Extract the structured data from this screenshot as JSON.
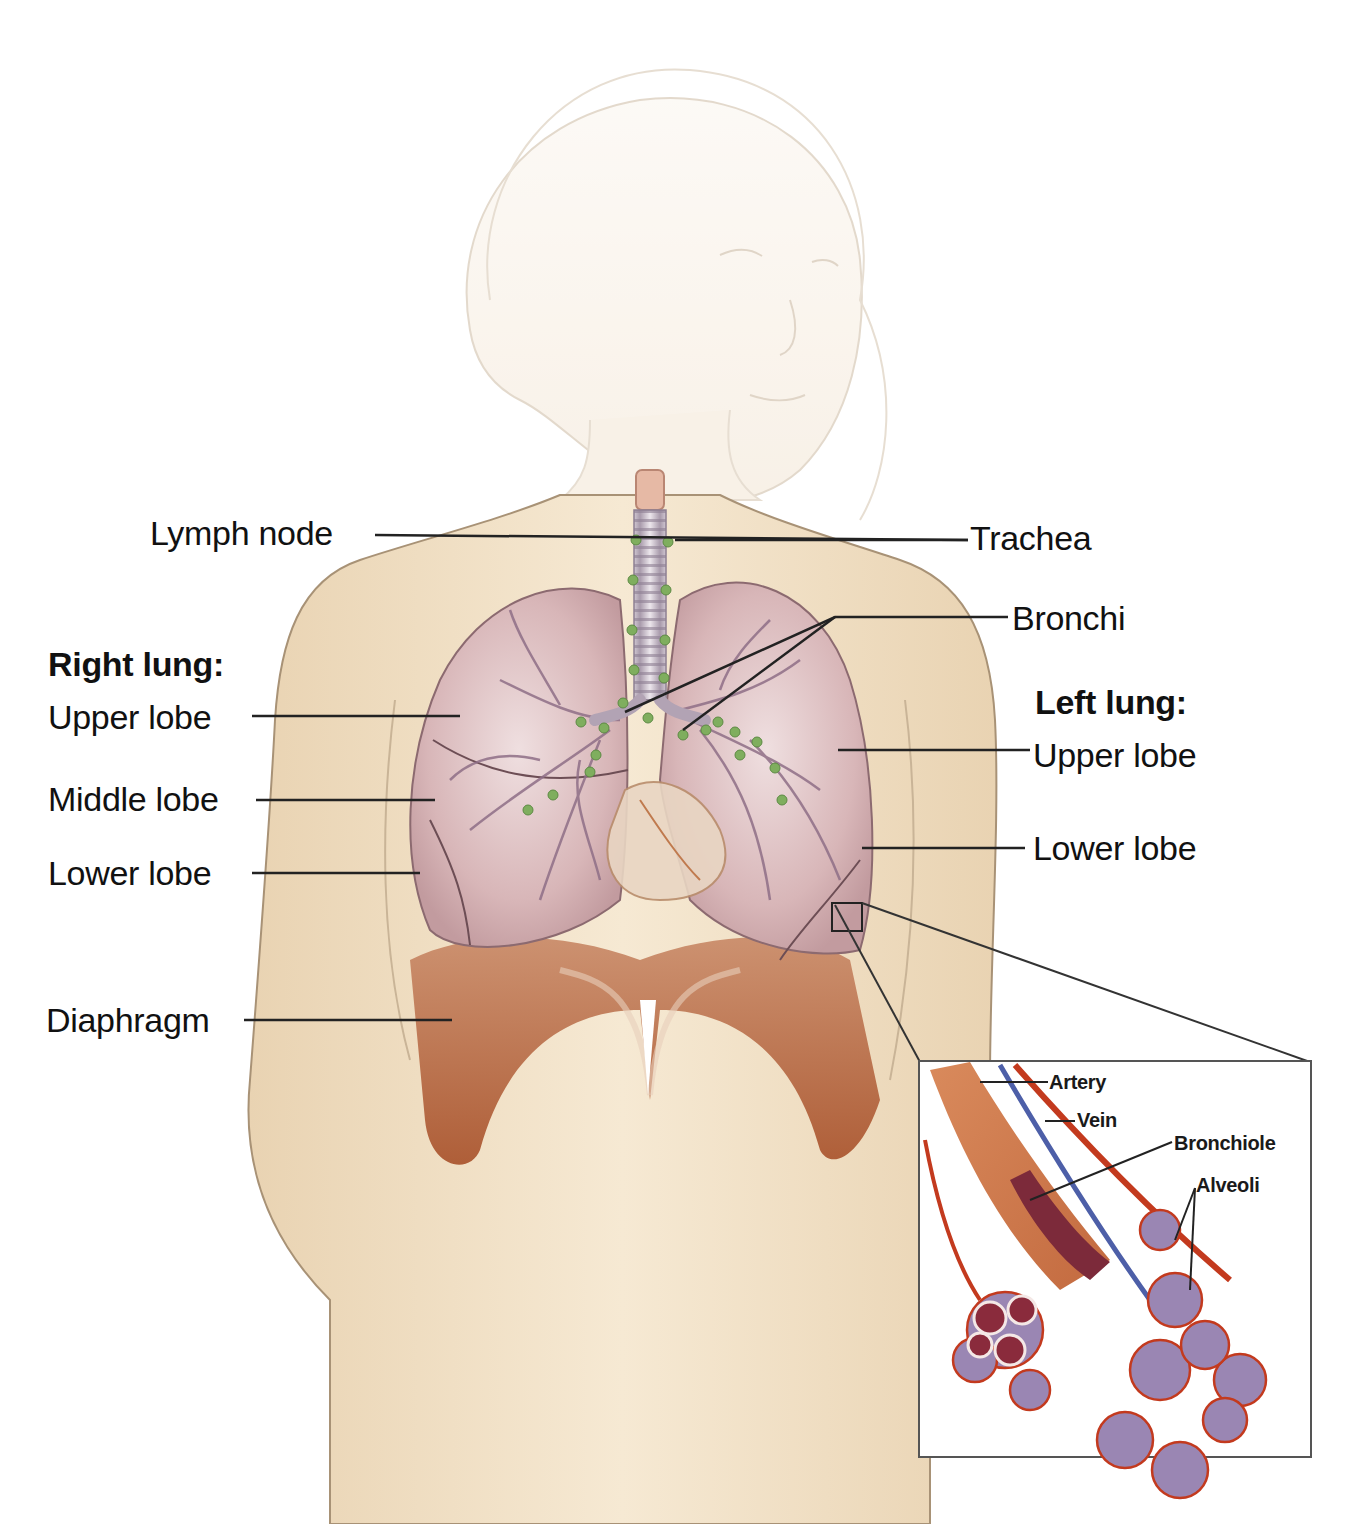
{
  "diagram": {
    "colors": {
      "skin": "#f1dfc3",
      "skin_outline": "#b9a48a",
      "lung": "#d9b7b8",
      "lung_shadow": "#b88f93",
      "bronchi_vessels": "#8f6f87",
      "lymph_node": "#7fae5e",
      "trachea": "#c9c0c8",
      "diaphragm": "#b7643c",
      "artery": "#c33a1e",
      "vein": "#4d5fa8",
      "bronchiole_interior": "#7c2a3a",
      "alveoli": "#9a86b3",
      "leader_line": "#222222"
    },
    "labels": {
      "lymph_node": "Lymph node",
      "trachea": "Trachea",
      "bronchi": "Bronchi",
      "right_lung_heading": "Right lung:",
      "right_upper_lobe": "Upper lobe",
      "right_middle_lobe": "Middle lobe",
      "right_lower_lobe": "Lower lobe",
      "left_lung_heading": "Left lung:",
      "left_upper_lobe": "Upper lobe",
      "left_lower_lobe": "Lower lobe",
      "diaphragm": "Diaphragm"
    },
    "inset": {
      "title": "Magnified view of lung tissue",
      "labels": {
        "artery": "Artery",
        "vein": "Vein",
        "bronchiole": "Bronchiole",
        "alveoli": "Alveoli"
      }
    }
  }
}
